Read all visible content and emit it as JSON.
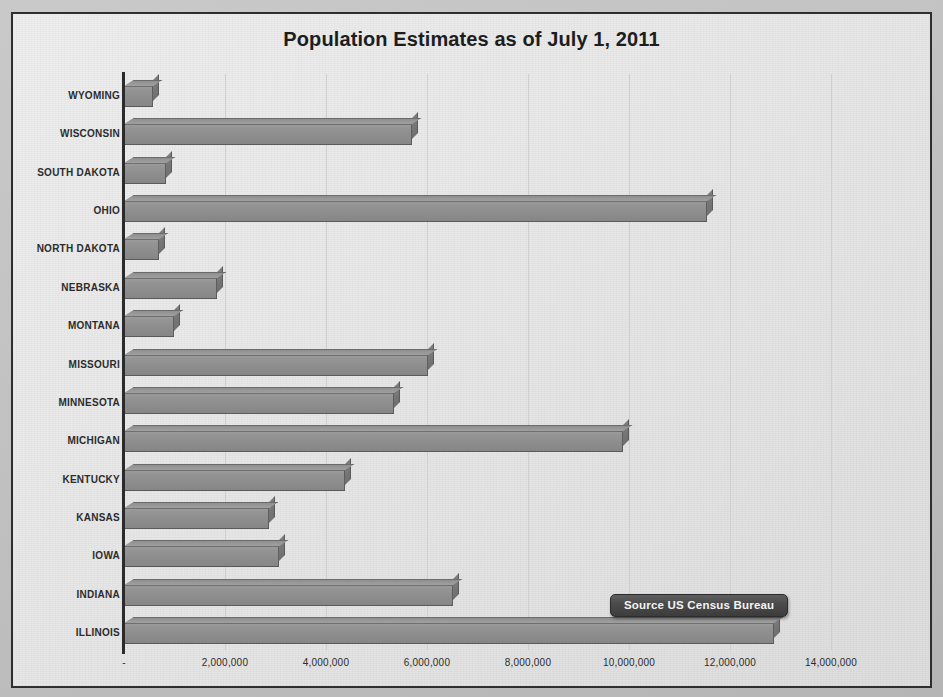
{
  "chart_data": {
    "type": "bar",
    "orientation": "horizontal",
    "title": "Population Estimates as of July 1, 2011",
    "xlabel": "",
    "ylabel": "",
    "xlim": [
      0,
      14000000
    ],
    "grid": true,
    "legend": false,
    "annotation": "Source US Census Bureau",
    "tick_labels": [
      "-",
      "2,000,000",
      "4,000,000",
      "6,000,000",
      "8,000,000",
      "10,000,000",
      "12,000,000",
      "14,000,000"
    ],
    "tick_values": [
      0,
      2000000,
      4000000,
      6000000,
      8000000,
      10000000,
      12000000,
      14000000
    ],
    "categories": [
      "WYOMING",
      "WISCONSIN",
      "SOUTH DAKOTA",
      "OHIO",
      "NORTH DAKOTA",
      "NEBRASKA",
      "MONTANA",
      "MISSOURI",
      "MINNESOTA",
      "MICHIGAN",
      "KENTUCKY",
      "KANSAS",
      "IOWA",
      "INDIANA",
      "ILLINOIS"
    ],
    "values": [
      568158,
      5711767,
      824082,
      11544951,
      683932,
      1842641,
      998199,
      6010688,
      5344861,
      9876187,
      4369356,
      2871238,
      3062309,
      6516922,
      12869257
    ]
  },
  "source_note": {
    "label": "Source US Census Bureau"
  },
  "colors": {
    "bar": "#8d8d8d",
    "bar_top": "#9b9b9b",
    "bar_side": "#767676",
    "plot_background": "#e8e8e8",
    "gridline": "#cfcfcf",
    "axis": "#2b2b2b",
    "title_text": "#1d1d1d",
    "label_text": "#2c2c2c",
    "callout_background": "#4a4a4a",
    "callout_text": "#f4f4f4",
    "border": "#2e2e2e"
  }
}
